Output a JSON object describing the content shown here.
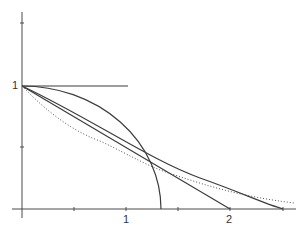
{
  "diagram": {
    "axes": {
      "x_tick_labels": [
        "1",
        "2"
      ],
      "y_tick_labels": [
        "1"
      ],
      "x_ticks": [
        0.5,
        1,
        1.5,
        2,
        2.5
      ],
      "y_ticks": [
        0.5,
        1,
        1.5
      ]
    },
    "curves": [
      {
        "name": "horizontal-segment",
        "style": "solid",
        "from": [
          0,
          1
        ],
        "to": [
          1,
          1
        ]
      },
      {
        "name": "elliptic-arc",
        "style": "solid",
        "from": [
          0,
          1
        ],
        "to": [
          1.34,
          0
        ]
      },
      {
        "name": "straight-line",
        "style": "solid",
        "from": [
          0,
          1
        ],
        "to": [
          2,
          0
        ]
      },
      {
        "name": "concave-curve",
        "style": "solid",
        "from": [
          0,
          1
        ],
        "to": [
          2.5,
          0
        ]
      },
      {
        "name": "dotted-decay-curve",
        "style": "dotted",
        "from": [
          0,
          1
        ],
        "to": [
          2.6,
          0.05
        ]
      }
    ]
  }
}
